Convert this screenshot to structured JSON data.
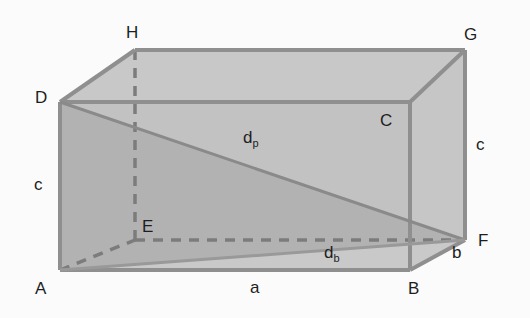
{
  "diagram": {
    "title": "",
    "type": "rectangular-cuboid",
    "colors": {
      "background": "#fbfbfb",
      "face_front": "#b4b4b4",
      "face_top": "#c8c8c8",
      "face_right": "#c6c6c6",
      "triangle": "#c4c4c4",
      "edge": "#8f8f8f",
      "hidden_edge": "#7c7c7c",
      "label": "#1e1e1e"
    },
    "vertices": {
      "A": "A",
      "B": "B",
      "C": "C",
      "D": "D",
      "E": "E",
      "F": "F",
      "G": "G",
      "H": "H"
    },
    "edges": {
      "length": "a",
      "width": "b",
      "height_left": "c",
      "height_right": "c"
    },
    "diagonals": {
      "space": {
        "main": "d",
        "sub": "p"
      },
      "base": {
        "main": "d",
        "sub": "b"
      }
    }
  }
}
